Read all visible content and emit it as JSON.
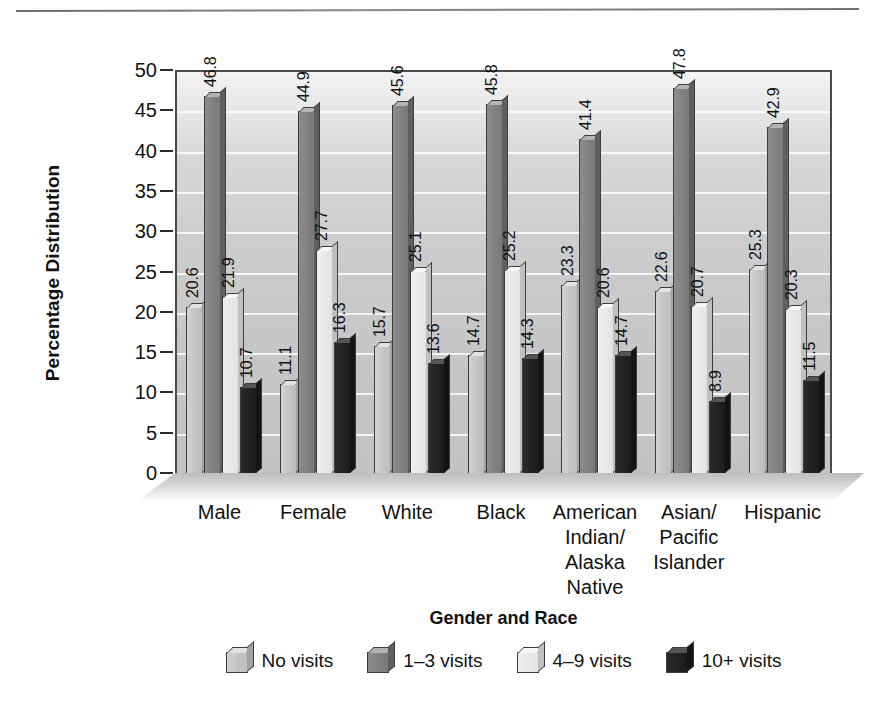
{
  "chart_data": {
    "type": "bar",
    "title": "",
    "xlabel": "Gender and Race",
    "ylabel": "Percentage Distribution",
    "ylim": [
      0,
      50
    ],
    "yticks": [
      0,
      5,
      10,
      15,
      20,
      25,
      30,
      35,
      40,
      45,
      50
    ],
    "grid": true,
    "legend_position": "bottom",
    "categories": [
      "Male",
      "Female",
      "White",
      "Black",
      "American\nIndian/\nAlaska\nNative",
      "Asian/\nPacific\nIslander",
      "Hispanic"
    ],
    "series": [
      {
        "name": "No visits",
        "color": "#c5c5c5",
        "values": [
          20.6,
          11.1,
          15.7,
          14.7,
          23.3,
          22.6,
          25.3
        ]
      },
      {
        "name": "1-3 visits",
        "color": "#828282",
        "values": [
          46.8,
          44.9,
          45.6,
          45.8,
          41.4,
          47.8,
          42.9
        ]
      },
      {
        "name": "4-9 visits",
        "color": "#e9e9e9",
        "values": [
          21.9,
          27.7,
          25.1,
          25.2,
          20.6,
          20.7,
          20.3
        ]
      },
      {
        "name": "10+ visits",
        "color": "#222222",
        "values": [
          10.7,
          16.3,
          13.6,
          14.3,
          14.7,
          8.9,
          11.5
        ]
      }
    ],
    "legend": [
      "No visits",
      "1–3 visits",
      "4–9 visits",
      "10+ visits"
    ]
  },
  "figure": {
    "y_axis_title": "Percentage Distribution",
    "x_axis_title": "Gender and Race"
  }
}
